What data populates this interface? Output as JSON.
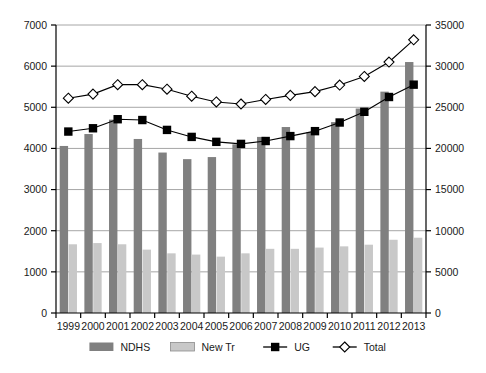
{
  "chart_data": {
    "type": "bar",
    "title": "",
    "subtitle": "",
    "xlabel": "",
    "ylabel": "",
    "categories": [
      "1999",
      "2000",
      "2001",
      "2002",
      "2003",
      "2004",
      "2005",
      "2006",
      "2007",
      "2008",
      "2009",
      "2010",
      "2011",
      "2012",
      "2013"
    ],
    "grid": true,
    "legend_position": "bottom",
    "axes": {
      "left": {
        "label": "",
        "min": 0,
        "max": 7000,
        "ticks": [
          0,
          1000,
          2000,
          3000,
          4000,
          5000,
          6000,
          7000
        ],
        "tick_labels": [
          "0",
          "1000",
          "2000",
          "3000",
          "4000",
          "5000",
          "6000",
          "7000"
        ],
        "series": [
          "NDHS",
          "New Tr"
        ]
      },
      "right": {
        "label": "",
        "min": 0,
        "max": 35000,
        "ticks": [
          0,
          5000,
          10000,
          15000,
          20000,
          25000,
          30000,
          35000
        ],
        "tick_labels": [
          "0",
          "5000",
          "10000",
          "15000",
          "20000",
          "25000",
          "30000",
          "35000"
        ],
        "series": [
          "UG",
          "Total"
        ]
      }
    },
    "series": [
      {
        "name": "NDHS",
        "type": "bar",
        "axis": "left",
        "color": "#808080",
        "values": [
          4060,
          4350,
          4700,
          4230,
          3900,
          3740,
          3790,
          4100,
          4280,
          4520,
          4400,
          4640,
          4970,
          5380,
          6100
        ]
      },
      {
        "name": "New Tr",
        "type": "bar",
        "axis": "left",
        "color": "#c8c8c8",
        "values": [
          1670,
          1700,
          1670,
          1540,
          1450,
          1420,
          1370,
          1450,
          1560,
          1560,
          1590,
          1620,
          1660,
          1780,
          1830
        ]
      },
      {
        "name": "UG",
        "type": "line",
        "axis": "right",
        "color": "#000000",
        "marker": "filled-square",
        "values": [
          22050,
          22450,
          23550,
          23450,
          22250,
          21400,
          20800,
          20550,
          20900,
          21500,
          22100,
          23150,
          24450,
          26250,
          27750
        ]
      },
      {
        "name": "Total",
        "type": "line",
        "axis": "right",
        "color": "#000000",
        "marker": "open-diamond",
        "values": [
          26100,
          26600,
          27750,
          27750,
          27200,
          26350,
          25650,
          25400,
          25950,
          26450,
          26900,
          27700,
          28750,
          30500,
          33200
        ]
      }
    ]
  },
  "legend": {
    "items": [
      {
        "label": "NDHS",
        "marker": "bar-dark"
      },
      {
        "label": "New Tr",
        "marker": "bar-light"
      },
      {
        "label": "UG",
        "marker": "line-square"
      },
      {
        "label": "Total",
        "marker": "line-diamond"
      }
    ]
  },
  "colors": {
    "ndhs_bar": "#808080",
    "newtr_bar": "#c8c8c8",
    "ug_line": "#000000",
    "total_line": "#000000",
    "grid": "#a6a6a6",
    "axis": "#000000",
    "background": "#ffffff"
  }
}
